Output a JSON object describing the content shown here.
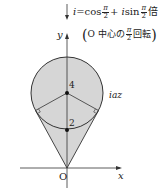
{
  "diagram": {
    "annotation": {
      "line1": {
        "prefix": "i",
        "equals": "=cos",
        "frac_num": "π",
        "frac_den": "2",
        "plus": "+ ",
        "i": "i",
        "sin": "sin",
        "frac2_num": "π",
        "frac2_den": "2",
        "suffix": "倍"
      },
      "line2": {
        "open": "(",
        "text": "O 中心の",
        "frac_num": "π",
        "frac_den": "2",
        "suffix": "回転",
        "close": ")"
      }
    },
    "axes": {
      "x_label": "x",
      "y_label": "y",
      "origin_label": "O"
    },
    "points": {
      "center_label": "4",
      "lower_label": "2"
    },
    "region_label": "iaz",
    "colors": {
      "fill": "#d6d6d6",
      "stroke": "#333333"
    }
  }
}
